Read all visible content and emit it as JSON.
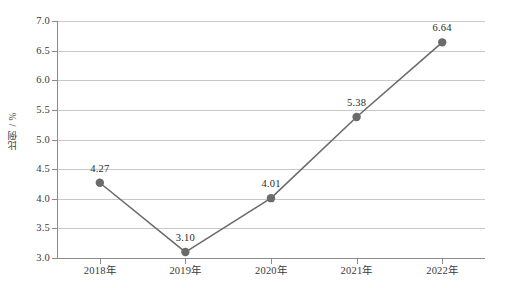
{
  "chart_data": {
    "type": "line",
    "title": "",
    "xlabel": "",
    "ylabel": "比例 / %",
    "categories": [
      "2018年",
      "2019年",
      "2020年",
      "2021年",
      "2022年"
    ],
    "values": [
      4.27,
      3.1,
      4.01,
      5.38,
      6.64
    ],
    "point_labels": [
      "4.27",
      "3.10",
      "4.01",
      "5.38",
      "6.64"
    ],
    "ylim": [
      3.0,
      7.0
    ],
    "yticks": [
      3.0,
      3.5,
      4.0,
      4.5,
      5.0,
      5.5,
      6.0,
      6.5,
      7.0
    ],
    "ytick_labels": [
      "3.0",
      "3.5",
      "4.0",
      "4.5",
      "5.0",
      "5.5",
      "6.0",
      "6.5",
      "7.0"
    ],
    "grid": true,
    "legend": false,
    "series": [
      {
        "name": "比例",
        "values": [
          4.27,
          3.1,
          4.01,
          5.38,
          6.64
        ],
        "color": "#6b6b6b",
        "marker": "circle"
      }
    ],
    "colors": {
      "line": "#6b6b6b",
      "marker": "#6b6b6b",
      "grid": "#c9c9c9",
      "axis": "#8a8a8a",
      "text": "#3a3a3a",
      "background": "#ffffff"
    }
  }
}
